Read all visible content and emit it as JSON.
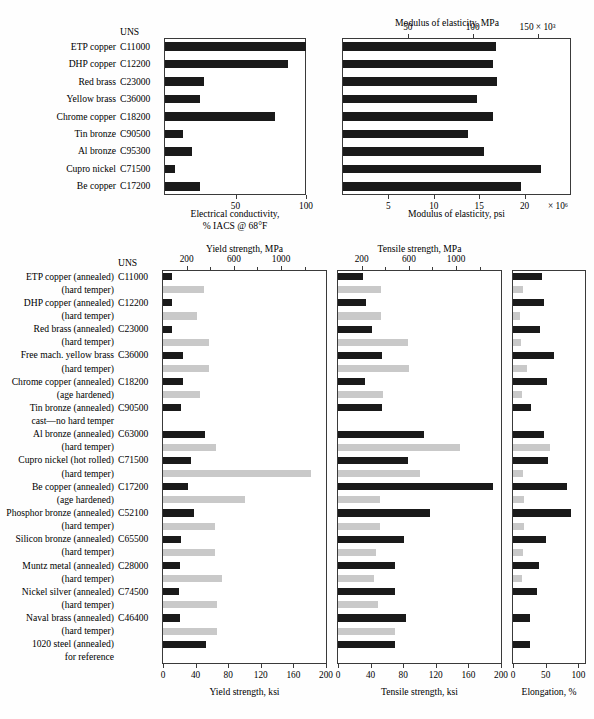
{
  "figure": {
    "uns_header": "UNS"
  },
  "chart_data": [
    {
      "id": "electrical-conductivity",
      "type": "bar",
      "orientation": "horizontal",
      "title": "",
      "xlabel": "Electrical conductivity,",
      "xlabel_line2": "% IACS @ 68°F",
      "ylabel": "",
      "xlim": [
        0,
        100
      ],
      "xticks": [
        0,
        50,
        100
      ],
      "xtick_labels": [
        "",
        "50",
        "100"
      ],
      "grid": false,
      "categories": [
        "ETP copper",
        "DHP copper",
        "Red brass",
        "Yellow brass",
        "Chrome copper",
        "Tin bronze",
        "Al bronze",
        "Cupro nickel",
        "Be copper"
      ],
      "uns": [
        "C11000",
        "C12200",
        "C23000",
        "C36000",
        "C18200",
        "C90500",
        "C95300",
        "C71500",
        "C17200"
      ],
      "values": [
        100,
        87,
        28,
        25,
        78,
        13,
        19,
        7,
        25
      ]
    },
    {
      "id": "modulus-of-elasticity",
      "type": "bar",
      "orientation": "horizontal",
      "title": "Modulus of elasticity, MPa",
      "xlabel": "Modulus of elasticity, psi",
      "xlim_top": [
        0,
        175
      ],
      "xticks_top": [
        50,
        100,
        150
      ],
      "xtick_labels_top": [
        "50",
        "100",
        "150 × 10³"
      ],
      "xlim_bottom": [
        0,
        25
      ],
      "xticks_bottom": [
        5,
        10,
        15,
        20
      ],
      "xtick_labels_bottom": [
        "5",
        "10",
        "15",
        "20"
      ],
      "xtick_exponent_bottom": "× 10⁶",
      "grid": false,
      "categories": [
        "ETP copper",
        "DHP copper",
        "Red brass",
        "Yellow brass",
        "Chrome copper",
        "Tin bronze",
        "Al bronze",
        "Cupro nickel",
        "Be copper"
      ],
      "values_psi_e6": [
        16.8,
        16.5,
        17.0,
        14.8,
        16.5,
        13.8,
        15.5,
        21.8,
        19.6
      ]
    },
    {
      "id": "yield-strength",
      "type": "bar",
      "orientation": "horizontal",
      "title": "Yield strength, MPa",
      "xlabel": "Yield strength, ksi",
      "xlim_top": [
        0,
        1380
      ],
      "xticks_top": [
        200,
        600,
        1000
      ],
      "xtick_labels_top": [
        "200",
        "600",
        "1000"
      ],
      "xlim_bottom": [
        0,
        200
      ],
      "xticks_bottom": [
        0,
        40,
        80,
        120,
        160,
        200
      ],
      "xtick_labels_bottom": [
        "0",
        "40",
        "80",
        "120",
        "160",
        "200"
      ],
      "grid": false,
      "series": [
        {
          "name": "annealed",
          "color": "#1a1a1a"
        },
        {
          "name": "hard temper",
          "color": "#c9c9c9"
        }
      ],
      "values_ksi": [
        11,
        50,
        11,
        42,
        11,
        57,
        25,
        57,
        24,
        46,
        22,
        0,
        52,
        65,
        34,
        182,
        31,
        100,
        38,
        64,
        22,
        64,
        21,
        72,
        20,
        66,
        53
      ]
    },
    {
      "id": "tensile-strength",
      "type": "bar",
      "orientation": "horizontal",
      "title": "Tensile strength, MPa",
      "xlabel": "Tensile strength, ksi",
      "xlim_top": [
        0,
        1380
      ],
      "xticks_top": [
        200,
        600,
        1000
      ],
      "xtick_labels_top": [
        "200",
        "600",
        "1000"
      ],
      "xlim_bottom": [
        0,
        200
      ],
      "xticks_bottom": [
        0,
        40,
        80,
        120,
        160,
        200
      ],
      "xtick_labels_bottom": [
        "0",
        "40",
        "80",
        "120",
        "160",
        "200"
      ],
      "grid": false,
      "values_ksi": [
        31,
        53,
        34,
        53,
        42,
        86,
        54,
        87,
        33,
        55,
        54,
        0,
        105,
        150,
        86,
        100,
        190,
        52,
        113,
        51,
        81,
        47,
        70,
        44,
        70,
        49,
        83,
        70
      ]
    },
    {
      "id": "elongation",
      "type": "bar",
      "orientation": "horizontal",
      "title": "",
      "xlabel": "Elongation, %",
      "xlim": [
        0,
        110
      ],
      "xticks": [
        0,
        50,
        100
      ],
      "xtick_labels": [
        "0",
        "50",
        "100"
      ],
      "grid": false,
      "values_pct": [
        45,
        15,
        48,
        10,
        42,
        12,
        62,
        22,
        52,
        13,
        28,
        0,
        48,
        56,
        53,
        16,
        82,
        17,
        88,
        17,
        50,
        15,
        40,
        14,
        37,
        0,
        26
      ]
    }
  ],
  "top_chart_rows": [
    {
      "name": "ETP copper",
      "uns": "C11000",
      "conductivity": 100,
      "modulus": 16.8
    },
    {
      "name": "DHP copper",
      "uns": "C12200",
      "conductivity": 87,
      "modulus": 16.5
    },
    {
      "name": "Red brass",
      "uns": "C23000",
      "conductivity": 28,
      "modulus": 17.0
    },
    {
      "name": "Yellow brass",
      "uns": "C36000",
      "conductivity": 25,
      "modulus": 14.8
    },
    {
      "name": "Chrome copper",
      "uns": "C18200",
      "conductivity": 78,
      "modulus": 16.5
    },
    {
      "name": "Tin bronze",
      "uns": "C90500",
      "conductivity": 13,
      "modulus": 13.8
    },
    {
      "name": "Al bronze",
      "uns": "C95300",
      "conductivity": 19,
      "modulus": 15.5
    },
    {
      "name": "Cupro nickel",
      "uns": "C71500",
      "conductivity": 7,
      "modulus": 21.8
    },
    {
      "name": "Be copper",
      "uns": "C17200",
      "conductivity": 25,
      "modulus": 19.6
    }
  ],
  "bottom_chart_rows": [
    {
      "label": "ETP copper (annealed)",
      "uns": "C11000",
      "temper": "annealed",
      "yield_ksi": 11,
      "tensile_ksi": 31,
      "elong_pct": 45
    },
    {
      "label": "(hard temper)",
      "uns": "",
      "temper": "hard",
      "yield_ksi": 50,
      "tensile_ksi": 53,
      "elong_pct": 15
    },
    {
      "label": "DHP copper (annealed)",
      "uns": "C12200",
      "temper": "annealed",
      "yield_ksi": 11,
      "tensile_ksi": 34,
      "elong_pct": 48
    },
    {
      "label": "(hard temper)",
      "uns": "",
      "temper": "hard",
      "yield_ksi": 42,
      "tensile_ksi": 53,
      "elong_pct": 10
    },
    {
      "label": "Red brass (annealed)",
      "uns": "C23000",
      "temper": "annealed",
      "yield_ksi": 11,
      "tensile_ksi": 42,
      "elong_pct": 42
    },
    {
      "label": "(hard temper)",
      "uns": "",
      "temper": "hard",
      "yield_ksi": 57,
      "tensile_ksi": 86,
      "elong_pct": 12
    },
    {
      "label": "Free mach. yellow brass",
      "uns": "C36000",
      "temper": "annealed",
      "yield_ksi": 25,
      "tensile_ksi": 54,
      "elong_pct": 62
    },
    {
      "label": "(hard temper)",
      "uns": "",
      "temper": "hard",
      "yield_ksi": 57,
      "tensile_ksi": 87,
      "elong_pct": 22
    },
    {
      "label": "Chrome copper (annealed)",
      "uns": "C18200",
      "temper": "annealed",
      "yield_ksi": 24,
      "tensile_ksi": 33,
      "elong_pct": 52
    },
    {
      "label": "(age hardened)",
      "uns": "",
      "temper": "hard",
      "yield_ksi": 46,
      "tensile_ksi": 55,
      "elong_pct": 13
    },
    {
      "label": "Tin bronze (annealed)",
      "uns": "C90500",
      "temper": "annealed",
      "yield_ksi": 22,
      "tensile_ksi": 54,
      "elong_pct": 28
    },
    {
      "label": "cast—no hard temper",
      "uns": "",
      "temper": "none",
      "yield_ksi": 0,
      "tensile_ksi": 0,
      "elong_pct": 0
    },
    {
      "label": "Al bronze (annealed)",
      "uns": "C63000",
      "temper": "annealed",
      "yield_ksi": 52,
      "tensile_ksi": 105,
      "elong_pct": 48
    },
    {
      "label": "(hard temper)",
      "uns": "",
      "temper": "hard",
      "yield_ksi": 65,
      "tensile_ksi": 150,
      "elong_pct": 56
    },
    {
      "label": "Cupro nickel (hot rolled)",
      "uns": "C71500",
      "temper": "annealed",
      "yield_ksi": 34,
      "tensile_ksi": 86,
      "elong_pct": 53
    },
    {
      "label": "(hard temper)",
      "uns": "",
      "temper": "hard",
      "yield_ksi": 182,
      "tensile_ksi": 100,
      "elong_pct": 16
    },
    {
      "label": "Be copper (annealed)",
      "uns": "C17200",
      "temper": "annealed",
      "yield_ksi": 31,
      "tensile_ksi": 190,
      "elong_pct": 82
    },
    {
      "label": "(age hardened)",
      "uns": "",
      "temper": "hard",
      "yield_ksi": 100,
      "tensile_ksi": 52,
      "elong_pct": 17
    },
    {
      "label": "Phosphor bronze (annealed)",
      "uns": "C52100",
      "temper": "annealed",
      "yield_ksi": 38,
      "tensile_ksi": 113,
      "elong_pct": 88
    },
    {
      "label": "(hard temper)",
      "uns": "",
      "temper": "hard",
      "yield_ksi": 64,
      "tensile_ksi": 51,
      "elong_pct": 17
    },
    {
      "label": "Silicon bronze (annealed)",
      "uns": "C65500",
      "temper": "annealed",
      "yield_ksi": 22,
      "tensile_ksi": 81,
      "elong_pct": 50
    },
    {
      "label": "(hard temper)",
      "uns": "",
      "temper": "hard",
      "yield_ksi": 64,
      "tensile_ksi": 47,
      "elong_pct": 15
    },
    {
      "label": "Muntz metal (annealed)",
      "uns": "C28000",
      "temper": "annealed",
      "yield_ksi": 21,
      "tensile_ksi": 70,
      "elong_pct": 40
    },
    {
      "label": "(hard temper)",
      "uns": "",
      "temper": "hard",
      "yield_ksi": 72,
      "tensile_ksi": 44,
      "elong_pct": 14
    },
    {
      "label": "Nickel silver (annealed)",
      "uns": "C74500",
      "temper": "annealed",
      "yield_ksi": 20,
      "tensile_ksi": 70,
      "elong_pct": 37
    },
    {
      "label": "(hard temper)",
      "uns": "",
      "temper": "hard",
      "yield_ksi": 66,
      "tensile_ksi": 49,
      "elong_pct": 0
    },
    {
      "label": "Naval brass (annealed)",
      "uns": "C46400",
      "temper": "annealed",
      "yield_ksi": 21,
      "tensile_ksi": 83,
      "elong_pct": 26
    },
    {
      "label": "(hard temper)",
      "uns": "",
      "temper": "hard",
      "yield_ksi": 66,
      "tensile_ksi": 70,
      "elong_pct": 0
    },
    {
      "label": "1020 steel (annealed)",
      "uns": "",
      "temper": "annealed",
      "yield_ksi": 53,
      "tensile_ksi": 70,
      "elong_pct": 26
    },
    {
      "label": "for reference",
      "uns": "",
      "temper": "none",
      "yield_ksi": 0,
      "tensile_ksi": 0,
      "elong_pct": 0
    }
  ],
  "colors": {
    "annealed": "#1a1a1a",
    "hard_temper": "#c9c9c9",
    "frame": "#3a3a3a",
    "background": "#fefefe"
  }
}
